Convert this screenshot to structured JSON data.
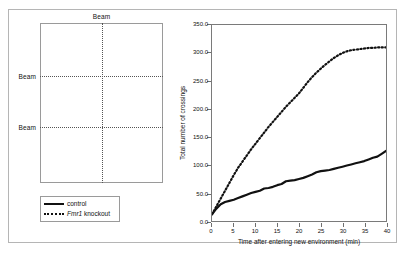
{
  "figure": {
    "panels": [
      "apparatus-diagram",
      "crossings-line-chart"
    ]
  },
  "apparatus": {
    "beam_label_top": "Beam",
    "beam_label_left_upper": "Beam",
    "beam_label_left_lower": "Beam",
    "box_border_color": "#9a9a9a",
    "beam_line_color": "#555555"
  },
  "legend": {
    "entries": [
      {
        "label": "control",
        "style": "solid",
        "italic_prefix": ""
      },
      {
        "label": " knockout",
        "style": "dotted",
        "italic_prefix": "Fmr1"
      }
    ],
    "entry_0_label": "control",
    "entry_1_italic": "Fmr1",
    "entry_1_rest": " knockout"
  },
  "chart_data": {
    "type": "line",
    "title": "",
    "xlabel": "Time after entering new environment (min)",
    "ylabel": "Total number of crossings",
    "xlim": [
      0,
      40
    ],
    "ylim": [
      0,
      350
    ],
    "grid": false,
    "legend_position": "outside-left-below-diagram",
    "xticks": [
      0,
      5,
      10,
      15,
      20,
      25,
      30,
      35,
      40
    ],
    "xtick_labels": [
      "0",
      "5",
      "10",
      "15",
      "20",
      "25",
      "30",
      "35",
      "40"
    ],
    "yticks": [
      0,
      50,
      100,
      150,
      200,
      250,
      300,
      350
    ],
    "ytick_labels": [
      "0.0",
      "50.0",
      "100.0",
      "150.0",
      "200.0",
      "250.0",
      "300.0",
      "350.0"
    ],
    "x": [
      0,
      1,
      2,
      3,
      4,
      5,
      6,
      7,
      8,
      9,
      10,
      11,
      12,
      13,
      14,
      15,
      16,
      17,
      18,
      19,
      20,
      21,
      22,
      23,
      24,
      25,
      26,
      27,
      28,
      29,
      30,
      31,
      32,
      33,
      34,
      35,
      36,
      37,
      38,
      39,
      40
    ],
    "series": [
      {
        "name": "control",
        "style": "solid",
        "color": "#111111",
        "values": [
          12,
          22,
          30,
          34,
          36,
          38,
          41,
          44,
          47,
          50,
          52,
          54,
          58,
          59,
          61,
          64,
          66,
          71,
          72,
          73,
          75,
          77,
          80,
          83,
          87,
          89,
          90,
          91,
          93,
          95,
          97,
          99,
          101,
          103,
          105,
          107,
          110,
          113,
          115,
          120,
          125
        ]
      },
      {
        "name": "Fmr1 knockout",
        "style": "dotted",
        "color": "#111111",
        "values": [
          12,
          26,
          40,
          54,
          68,
          82,
          95,
          106,
          117,
          128,
          138,
          148,
          158,
          168,
          177,
          186,
          195,
          204,
          212,
          220,
          228,
          238,
          248,
          257,
          265,
          272,
          279,
          285,
          291,
          296,
          300,
          303,
          305,
          306,
          307,
          308,
          309,
          309,
          310,
          310,
          310
        ]
      }
    ]
  }
}
